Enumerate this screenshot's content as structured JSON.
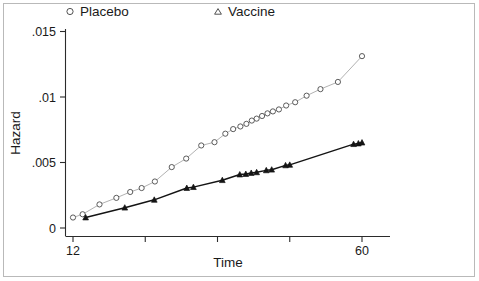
{
  "chart_data": {
    "type": "line",
    "title": "",
    "subtitle": "",
    "xlabel": "Time",
    "ylabel": "Hazard",
    "xlim": [
      12,
      62
    ],
    "ylim": [
      0,
      0.0163
    ],
    "grid": false,
    "legend_position": "top",
    "x_ticks": [
      12,
      24,
      36,
      48,
      60
    ],
    "x_tick_labels": [
      "12",
      "",
      "",
      "",
      "60"
    ],
    "y_ticks": [
      0,
      0.005,
      0.01,
      0.015
    ],
    "y_tick_labels": [
      "0",
      ".005",
      ".01",
      ".015"
    ],
    "series": [
      {
        "name": "Placebo",
        "marker": "open-circle",
        "color": "#8c8c8c",
        "marker_edge_color": "#4a4a4a",
        "line_color": "#a8a8a8",
        "x": [
          12.0,
          13.6,
          16.4,
          19.2,
          21.5,
          23.4,
          25.6,
          28.4,
          30.8,
          33.3,
          35.5,
          37.3,
          38.6,
          39.8,
          40.8,
          41.7,
          42.5,
          43.4,
          44.3,
          45.2,
          46.2,
          47.4,
          48.9,
          50.8,
          53.1,
          56.0,
          60.0
        ],
        "y": [
          0.0008,
          0.00105,
          0.0018,
          0.0023,
          0.00275,
          0.00305,
          0.00355,
          0.00465,
          0.0053,
          0.0063,
          0.00655,
          0.0072,
          0.00755,
          0.00775,
          0.00795,
          0.0082,
          0.00835,
          0.00855,
          0.00875,
          0.0089,
          0.00905,
          0.00935,
          0.0096,
          0.0101,
          0.0106,
          0.01115,
          0.01312
        ]
      },
      {
        "name": "Vaccine",
        "marker": "filled-triangle",
        "color": "#141414",
        "marker_edge_color": "#141414",
        "line_color": "#141414",
        "x": [
          14.1,
          20.6,
          25.5,
          30.9,
          32.0,
          36.8,
          39.7,
          40.7,
          41.6,
          42.5,
          44.1,
          45.0,
          47.3,
          48.0,
          58.6,
          59.4,
          60.0
        ],
        "y": [
          0.0008,
          0.00155,
          0.00215,
          0.00305,
          0.00312,
          0.00365,
          0.00408,
          0.00412,
          0.0042,
          0.00425,
          0.0044,
          0.00445,
          0.00478,
          0.00482,
          0.0064,
          0.00645,
          0.00652
        ]
      }
    ]
  },
  "legend": {
    "items": [
      {
        "label": "Placebo",
        "marker": "open-circle"
      },
      {
        "label": "Vaccine",
        "marker": "open-triangle"
      }
    ]
  },
  "axis": {
    "x_title": "Time",
    "y_title": "Hazard"
  }
}
